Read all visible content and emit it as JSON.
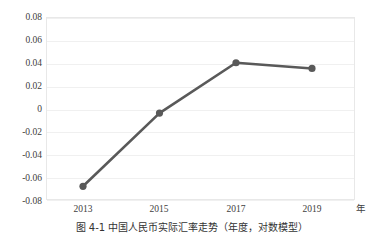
{
  "chart_data": {
    "type": "line",
    "title": "",
    "subtitle": "",
    "xlabel": "年",
    "ylabel": "",
    "x": [
      2013,
      2015,
      2017,
      2019
    ],
    "categories": [
      "2013",
      "2015",
      "2017",
      "2019"
    ],
    "values": [
      -0.068,
      -0.004,
      0.04,
      0.035
    ],
    "series": [
      {
        "name": "",
        "values": [
          -0.068,
          -0.004,
          0.04,
          0.035
        ]
      }
    ],
    "ylim": [
      -0.08,
      0.08
    ],
    "xlim": [
      2012,
      2020.5
    ],
    "y_ticks": [
      0.08,
      0.06,
      0.04,
      0.02,
      0,
      -0.02,
      -0.04,
      -0.06,
      -0.08
    ],
    "y_tick_labels": [
      "0.08",
      "0.06",
      "0.04",
      "0.02",
      "0",
      "-0.02",
      "-0.04",
      "-0.06",
      "-0.08"
    ],
    "x_ticks": [
      2013,
      2015,
      2017,
      2019
    ],
    "x_tick_labels": [
      "2013",
      "2015",
      "2017",
      "2019"
    ],
    "grid": true,
    "grid_axis": "y",
    "legend": false,
    "legend_position": "none",
    "marker": "circle",
    "line_color": "#595959",
    "marker_color": "#595959",
    "grid_color": "#f0f0f0",
    "border_color": "#e8e8e8"
  },
  "axes": {
    "x_unit_label": "年"
  },
  "caption": {
    "text": "图 4-1 中国人民币实际汇率走势（年度，对数模型）"
  }
}
